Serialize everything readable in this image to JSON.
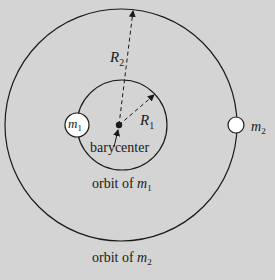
{
  "diagram": {
    "colors": {
      "background": "#d4d4d4",
      "line": "#1a1a1a",
      "body_fill": "#ffffff"
    },
    "labels": {
      "R2_base": "R",
      "R2_sub": "2",
      "R1_base": "R",
      "R1_sub": "1",
      "m1_base": "m",
      "m1_sub": "1",
      "m2_base": "m",
      "m2_sub": "2",
      "barycenter": "barycenter",
      "orbit_m1_prefix": "orbit of ",
      "orbit_m1_base": "m",
      "orbit_m1_sub": "1",
      "orbit_m2_prefix": "orbit of ",
      "orbit_m2_base": "m",
      "orbit_m2_sub": "2"
    }
  }
}
